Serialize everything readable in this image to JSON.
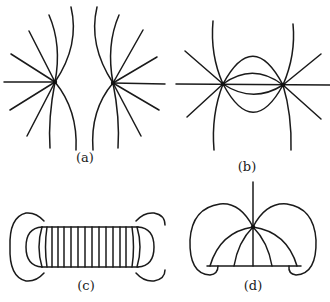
{
  "figure": {
    "panels": [
      {
        "id": "a",
        "label": "(a)",
        "description": "Field lines of two like charges (repelling)"
      },
      {
        "id": "b",
        "label": "(b)",
        "description": "Field lines of two opposite charges (attracting)"
      },
      {
        "id": "c",
        "label": "(c)",
        "description": "Field lines of a solenoid / parallel plates with fringing"
      },
      {
        "id": "d",
        "label": "(d)",
        "description": "Field lines of a point near a plane with closed loops"
      }
    ],
    "colors": {
      "line": "#1a1a1a",
      "background": "#ffffff"
    }
  }
}
